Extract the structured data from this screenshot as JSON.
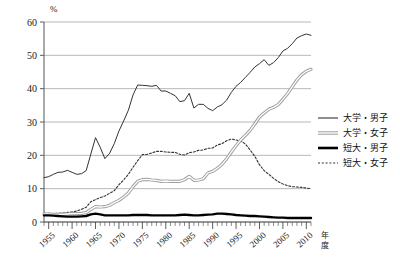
{
  "chart_data": {
    "type": "line",
    "title": "",
    "xlabel": "年度",
    "ylabel": "%",
    "unit_label": "%",
    "xlim": [
      1954,
      2011
    ],
    "ylim": [
      0,
      60
    ],
    "yticks": [
      0,
      10,
      20,
      30,
      40,
      50,
      60
    ],
    "xticks": [
      1955,
      1960,
      1965,
      1970,
      1975,
      1980,
      1985,
      1990,
      1995,
      2000,
      2005,
      2010
    ],
    "xtick_labels": [
      "1955",
      "1960",
      "1965",
      "1970",
      "1975",
      "1980",
      "1985",
      "1990",
      "1995",
      "2000",
      "2005",
      "2010"
    ],
    "ytick_labels": [
      "0",
      "10",
      "20",
      "30",
      "40",
      "50",
      "60"
    ],
    "grid": "horizontal",
    "minor_tick_interval": 1,
    "legend_position": "right",
    "x": [
      1954,
      1955,
      1956,
      1957,
      1958,
      1959,
      1960,
      1961,
      1962,
      1963,
      1964,
      1965,
      1966,
      1967,
      1968,
      1969,
      1970,
      1971,
      1972,
      1973,
      1974,
      1975,
      1976,
      1977,
      1978,
      1979,
      1980,
      1981,
      1982,
      1983,
      1984,
      1985,
      1986,
      1987,
      1988,
      1989,
      1990,
      1991,
      1992,
      1993,
      1994,
      1995,
      1996,
      1997,
      1998,
      1999,
      2000,
      2001,
      2002,
      2003,
      2004,
      2005,
      2006,
      2007,
      2008,
      2009,
      2010,
      2011
    ],
    "series": [
      {
        "name": "大学・男子",
        "style": "solid-thin-dark",
        "color": "#333333",
        "values": [
          13.3,
          13.6,
          14.3,
          14.9,
          15.0,
          15.5,
          14.9,
          14.3,
          14.5,
          15.4,
          20.4,
          25.3,
          22.4,
          19.0,
          20.6,
          23.5,
          27.3,
          30.3,
          33.5,
          38.1,
          41.1,
          41.0,
          40.9,
          40.7,
          41.0,
          39.3,
          39.3,
          38.6,
          37.9,
          36.1,
          36.4,
          38.6,
          34.2,
          35.3,
          35.3,
          34.1,
          33.4,
          34.5,
          35.2,
          36.6,
          38.9,
          40.7,
          41.9,
          43.4,
          44.9,
          46.5,
          47.5,
          48.7,
          47.0,
          47.8,
          49.3,
          51.3,
          52.1,
          53.5,
          55.2,
          55.9,
          56.4,
          56.0
        ],
        "peak": {
          "year": 2010,
          "value": 56.4
        },
        "start": {
          "year": 1954,
          "value": 13.3
        },
        "end": {
          "year": 2011,
          "value": 56.0
        }
      },
      {
        "name": "大学・女子",
        "style": "solid-double-gray",
        "color": "#8c8c8c",
        "values": [
          2.4,
          2.4,
          2.3,
          2.3,
          2.3,
          2.4,
          2.5,
          2.5,
          2.6,
          2.8,
          3.8,
          4.6,
          4.5,
          4.6,
          5.0,
          5.8,
          6.5,
          7.5,
          8.7,
          10.6,
          12.2,
          12.7,
          12.8,
          12.6,
          12.5,
          12.2,
          12.3,
          12.2,
          12.2,
          12.2,
          12.7,
          13.7,
          12.5,
          12.6,
          13.0,
          14.7,
          15.2,
          16.1,
          17.3,
          19.0,
          21.0,
          22.9,
          24.6,
          26.0,
          27.5,
          29.4,
          31.5,
          32.7,
          33.8,
          34.4,
          35.2,
          36.8,
          38.5,
          40.6,
          42.6,
          44.2,
          45.2,
          45.8
        ],
        "peak": {
          "year": 2011,
          "value": 45.8
        },
        "start": {
          "year": 1954,
          "value": 2.4
        },
        "end": {
          "year": 2011,
          "value": 45.8
        }
      },
      {
        "name": "短大・男子",
        "style": "solid-thick-black",
        "color": "#000000",
        "values": [
          2.0,
          2.0,
          1.9,
          1.8,
          1.7,
          1.6,
          1.6,
          1.6,
          1.7,
          1.8,
          2.3,
          2.5,
          2.3,
          2.0,
          2.0,
          2.0,
          2.0,
          2.0,
          2.0,
          2.1,
          2.1,
          2.1,
          2.1,
          2.0,
          2.0,
          2.0,
          2.0,
          2.0,
          2.0,
          2.1,
          2.2,
          2.1,
          2.0,
          2.0,
          2.1,
          2.2,
          2.3,
          2.5,
          2.5,
          2.4,
          2.3,
          2.1,
          2.0,
          1.9,
          1.8,
          1.8,
          1.7,
          1.6,
          1.5,
          1.4,
          1.3,
          1.3,
          1.2,
          1.2,
          1.2,
          1.2,
          1.2,
          1.2
        ],
        "peak": {
          "year": 1992,
          "value": 2.5
        },
        "start": {
          "year": 1954,
          "value": 2.0
        },
        "end": {
          "year": 2011,
          "value": 1.2
        }
      },
      {
        "name": "短大・女子",
        "style": "dotted-dark",
        "color": "#333333",
        "values": [
          2.6,
          2.6,
          2.5,
          2.6,
          2.7,
          2.9,
          3.0,
          3.3,
          3.8,
          4.4,
          6.1,
          6.7,
          7.3,
          7.8,
          8.6,
          9.4,
          11.2,
          12.6,
          14.3,
          16.4,
          18.4,
          20.2,
          20.3,
          20.7,
          21.2,
          21.2,
          21.0,
          20.9,
          20.9,
          20.3,
          20.1,
          20.8,
          21.0,
          21.5,
          21.6,
          22.1,
          22.2,
          23.1,
          23.5,
          24.4,
          24.9,
          24.6,
          24.3,
          23.4,
          21.6,
          19.7,
          17.2,
          15.4,
          14.3,
          13.1,
          12.1,
          11.4,
          10.9,
          10.6,
          10.5,
          10.4,
          10.2,
          10.0
        ],
        "peak": {
          "year": 1994,
          "value": 24.9
        },
        "start": {
          "year": 1954,
          "value": 2.6
        },
        "end": {
          "year": 2011,
          "value": 10.0
        }
      }
    ]
  },
  "legend": {
    "items": [
      {
        "label": "大学・男子"
      },
      {
        "label": "大学・女子"
      },
      {
        "label": "短大・男子"
      },
      {
        "label": "短大・女子"
      }
    ]
  },
  "axes": {
    "y_unit": "%",
    "x_name_line1": "年",
    "x_name_line2": "度"
  }
}
